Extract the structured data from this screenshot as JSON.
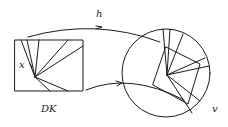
{
  "diagram": {
    "type": "mapping-diagram",
    "labels": {
      "map_top": "h",
      "point": "x",
      "domain": "DK",
      "target": "v"
    },
    "colors": {
      "stroke": "#1a1a1a",
      "background": "#ffffff"
    }
  }
}
